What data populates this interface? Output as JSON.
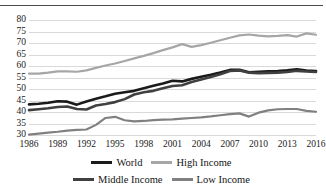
{
  "figure": {
    "title_cropped": "",
    "background": "#ffffff"
  },
  "axes": {
    "y_ticks": [
      "80",
      "75",
      "70",
      "65",
      "60",
      "55",
      "50",
      "45",
      "40",
      "35",
      "30"
    ],
    "x_ticks": [
      "1986",
      "1989",
      "1992",
      "1995",
      "1998",
      "2001",
      "2004",
      "2007",
      "2010",
      "2013",
      "2016"
    ]
  },
  "legend": {
    "row1": [
      {
        "label": "World",
        "color": "#1a1a1a"
      },
      {
        "label": "High Income",
        "color": "#a6a6a6"
      }
    ],
    "row2": [
      {
        "label": "Middle Income",
        "color": "#404040"
      },
      {
        "label": "Low Income",
        "color": "#808080"
      }
    ]
  },
  "chart_data": {
    "type": "line",
    "title": "",
    "xlabel": "",
    "ylabel": "",
    "xlim": [
      1986,
      2016
    ],
    "ylim": [
      28,
      82
    ],
    "yticks": [
      30,
      35,
      40,
      45,
      50,
      55,
      60,
      65,
      70,
      75,
      80
    ],
    "xticks": [
      1986,
      1989,
      1992,
      1995,
      1998,
      2001,
      2004,
      2007,
      2010,
      2013,
      2016
    ],
    "grid": "horizontal",
    "legend_position": "bottom",
    "x": [
      1986,
      1987,
      1988,
      1989,
      1990,
      1991,
      1992,
      1993,
      1994,
      1995,
      1996,
      1997,
      1998,
      1999,
      2000,
      2001,
      2002,
      2003,
      2004,
      2005,
      2006,
      2007,
      2008,
      2009,
      2010,
      2011,
      2012,
      2013,
      2014,
      2015,
      2016
    ],
    "series": [
      {
        "name": "World",
        "color": "#1a1a1a",
        "width": 2.6,
        "values": [
          43.3,
          43.6,
          44.0,
          44.7,
          44.5,
          43.2,
          44.6,
          45.8,
          46.8,
          47.9,
          48.6,
          49.2,
          50.3,
          51.4,
          52.4,
          53.6,
          53.3,
          54.4,
          55.3,
          56.2,
          57.2,
          58.3,
          58.4,
          57.3,
          57.5,
          57.7,
          57.8,
          58.1,
          58.6,
          58.0,
          57.8
        ]
      },
      {
        "name": "High Income",
        "color": "#a6a6a6",
        "width": 2.2,
        "values": [
          56.7,
          56.7,
          57.1,
          57.7,
          57.7,
          57.5,
          58.1,
          59.2,
          60.2,
          61.1,
          62.2,
          63.3,
          64.4,
          65.6,
          66.9,
          68.1,
          69.5,
          68.3,
          69.1,
          70.1,
          71.2,
          72.3,
          73.3,
          73.7,
          73.2,
          72.9,
          73.1,
          73.4,
          72.8,
          74.2,
          73.6
        ]
      },
      {
        "name": "Middle Income",
        "color": "#404040",
        "width": 2.6,
        "values": [
          40.8,
          41.2,
          41.6,
          42.2,
          42.4,
          41.3,
          41.1,
          42.8,
          43.5,
          44.3,
          45.6,
          47.6,
          48.6,
          49.2,
          50.3,
          51.3,
          51.6,
          53.0,
          54.1,
          55.2,
          56.4,
          57.8,
          58.1,
          57.1,
          56.9,
          57.0,
          57.1,
          57.4,
          57.9,
          57.6,
          57.4
        ]
      },
      {
        "name": "Low Income",
        "color": "#808080",
        "width": 2.2,
        "values": [
          30.2,
          30.6,
          31.0,
          31.4,
          31.9,
          32.2,
          32.4,
          34.4,
          37.4,
          37.9,
          36.4,
          35.9,
          36.1,
          36.5,
          36.7,
          36.8,
          37.1,
          37.4,
          37.7,
          38.1,
          38.6,
          39.1,
          39.4,
          38.0,
          39.7,
          40.7,
          41.2,
          41.3,
          41.3,
          40.5,
          40.1
        ]
      }
    ]
  }
}
